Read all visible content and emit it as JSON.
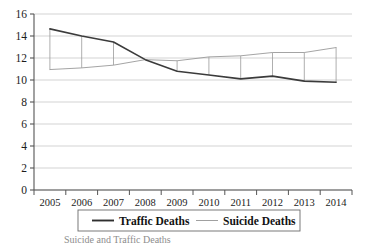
{
  "chart_data": {
    "type": "line",
    "title": "",
    "subtitle": "",
    "xlabel": "",
    "ylabel": "",
    "categories": [
      "2005",
      "2006",
      "2007",
      "2008",
      "2009",
      "2010",
      "2011",
      "2012",
      "2013",
      "2014"
    ],
    "series": [
      {
        "name": "Traffic Deaths",
        "color": "#3b3b3b",
        "line_width": 1.6,
        "values": [
          14.65,
          14.0,
          13.45,
          11.85,
          10.8,
          10.45,
          10.1,
          10.35,
          9.9,
          9.8
        ]
      },
      {
        "name": "Suicide Deaths",
        "color": "#9a9a9a",
        "line_width": 0.9,
        "values": [
          10.95,
          11.1,
          11.35,
          11.85,
          11.75,
          12.1,
          12.2,
          12.5,
          12.5,
          12.95
        ]
      }
    ],
    "connectors": true,
    "ylim": [
      0,
      16
    ],
    "yticks": [
      0,
      2,
      4,
      6,
      8,
      10,
      12,
      14,
      16
    ],
    "ytick_labels": [
      "0",
      "2",
      "4",
      "6",
      "8",
      "10",
      "12",
      "14",
      "16"
    ],
    "grid": true,
    "grid_axis": "y",
    "grid_color": "#c8c8c8",
    "axis_color": "#555555",
    "legend": {
      "position": "bottom",
      "entries": [
        {
          "label": "Traffic Deaths",
          "color": "#2f2f2f",
          "width": 1.9
        },
        {
          "label": "Suicide Deaths",
          "color": "#a0a0a0",
          "width": 1.0
        }
      ]
    },
    "caption": "Suicide and Traffic Deaths"
  },
  "plot": {
    "left": 34,
    "right": 352,
    "top": 14,
    "bottom": 190
  }
}
